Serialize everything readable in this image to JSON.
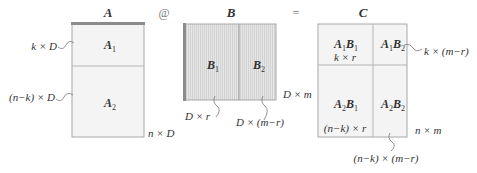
{
  "operators": {
    "matmul": "@",
    "equals": "="
  },
  "matrix_a": {
    "title": "A",
    "block_top": {
      "base": "A",
      "sub": "1"
    },
    "block_bottom": {
      "base": "A",
      "sub": "2"
    },
    "label_top": "k × D",
    "label_bottom": "(n−k) × D",
    "shape": "n × D"
  },
  "matrix_b": {
    "title": "B",
    "block_left": {
      "base": "B",
      "sub": "1"
    },
    "block_right": {
      "base": "B",
      "sub": "2"
    },
    "label_left": "D × r",
    "label_right": "D × (m−r)",
    "shape": "D × m"
  },
  "matrix_c": {
    "title": "C",
    "blocks": {
      "tl": {
        "a": "A",
        "as": "1",
        "b": "B",
        "bs": "1"
      },
      "tr": {
        "a": "A",
        "as": "1",
        "b": "B",
        "bs": "2"
      },
      "bl": {
        "a": "A",
        "as": "2",
        "b": "B",
        "bs": "1"
      },
      "br": {
        "a": "A",
        "as": "2",
        "b": "B",
        "bs": "2"
      }
    },
    "label_tl": "k × r",
    "label_bl": "(n−k) × r",
    "label_tr": "k × (m−r)",
    "label_br": "(n−k) × (m−r)",
    "shape": "n × m"
  },
  "colors": {
    "border": "#a8a8a8",
    "fill_a": "#f4f4f4",
    "fill_b": "#e2e2e2",
    "fill_c": "#f4f4f4",
    "accent_bar": "#8c8c8c"
  }
}
